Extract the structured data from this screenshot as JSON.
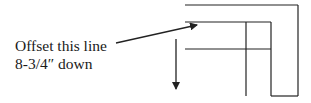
{
  "annotation": {
    "line1": "Offset this line",
    "line2": "8-3/4″ down"
  },
  "colors": {
    "stroke": "#222222",
    "text": "#1a1a1a",
    "background": "#ffffff"
  },
  "shapes": {
    "pointer_arrow": "arrow pointing from label to second horizontal line",
    "direction_arrow": "downward arrow indicating offset direction"
  }
}
